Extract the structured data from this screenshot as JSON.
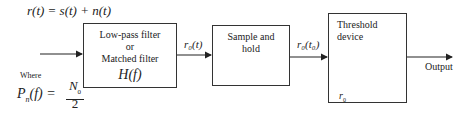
{
  "equation_top": "r(t) = s(t) + n(t)",
  "where_label": "Where",
  "psd_lhs": "P",
  "psd_sub": "n",
  "psd_arg": "(f) =",
  "psd_num": "N",
  "psd_num_sub": "0",
  "psd_den": "2",
  "blocks": [
    {
      "id": "filter",
      "lines": [
        "Low-pass filter",
        "or",
        "Matched filter"
      ],
      "math": "H(f)"
    },
    {
      "id": "sample",
      "lines": [
        "Sample and",
        "hold"
      ]
    },
    {
      "id": "threshold",
      "lines": [
        "Threshold",
        "device"
      ],
      "threshold_symbol": "r",
      "threshold_sub": "0"
    }
  ],
  "signals": {
    "filter_out": "r₀(t)",
    "sample_out": "r₀(t₀)",
    "output": "Output"
  }
}
